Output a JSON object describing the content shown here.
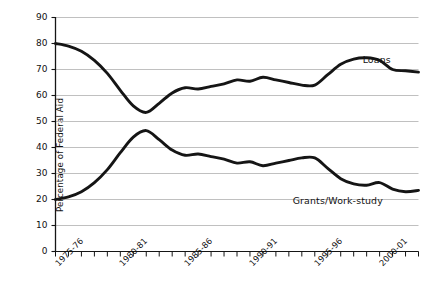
{
  "chart_data": {
    "type": "line",
    "title": "",
    "xlabel": "",
    "ylabel": "Percentage of Federal Aid",
    "ylim": [
      0,
      90
    ],
    "ytick_values": [
      0,
      10,
      20,
      30,
      40,
      50,
      60,
      70,
      80,
      90
    ],
    "ytick_labels": [
      "0",
      "10",
      "20",
      "30",
      "40",
      "50",
      "60",
      "70",
      "80",
      "90"
    ],
    "grid": true,
    "legend_position": "inline-annotations",
    "x_axis_note": "academic years, one tick per year from 1975-76 to 2003-04",
    "categories": [
      "1975-76",
      "1976-77",
      "1977-78",
      "1978-79",
      "1979-80",
      "1980-81",
      "1981-82",
      "1982-83",
      "1983-84",
      "1984-85",
      "1985-86",
      "1986-87",
      "1987-88",
      "1988-89",
      "1989-90",
      "1990-91",
      "1991-92",
      "1992-93",
      "1993-94",
      "1994-95",
      "1995-96",
      "1996-97",
      "1997-98",
      "1998-99",
      "1999-00",
      "2000-01",
      "2001-02",
      "2002-03",
      "2003-04"
    ],
    "xtick_labels_shown": [
      "1975-76",
      "1980-81",
      "1985-86",
      "1990-91",
      "1995-96",
      "2000-01"
    ],
    "series": [
      {
        "name": "Loans",
        "color": "#151515",
        "values": [
          80,
          79,
          77,
          73.5,
          68.5,
          62,
          56,
          53.5,
          57,
          61,
          63,
          62.5,
          63.5,
          64.5,
          66,
          65.5,
          67,
          66,
          65,
          64,
          64,
          68,
          72,
          74,
          74.5,
          73.5,
          70,
          69.5,
          69
        ]
      },
      {
        "name": "Grants/Work-study",
        "color": "#151515",
        "values": [
          20,
          21,
          23,
          26.5,
          31.5,
          38,
          44,
          46.5,
          43,
          39,
          37,
          37.5,
          36.5,
          35.5,
          34,
          34.5,
          33,
          34,
          35,
          36,
          36,
          32,
          28,
          26,
          25.5,
          26.5,
          24,
          23,
          23.5
        ]
      }
    ],
    "annotations": [
      {
        "text": "Loans",
        "x": "1999-00",
        "y": 74
      },
      {
        "text": "Grants/Work-study",
        "x": "1997-98",
        "y": 20
      }
    ]
  },
  "colors": {
    "line": "#151515",
    "grid": "#b9b9b9",
    "axis": "#151515",
    "background": "#ffffff",
    "text": "#111111"
  }
}
